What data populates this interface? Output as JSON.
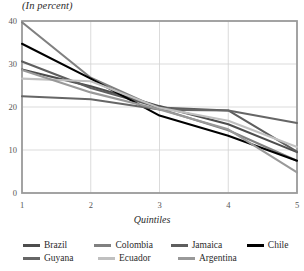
{
  "chart_data": {
    "type": "line",
    "title": "",
    "subtitle": "(In percent)",
    "xlabel": "Quintiles",
    "ylabel": "",
    "x": [
      1,
      2,
      3,
      4,
      5
    ],
    "xtick_labels": [
      "1",
      "2",
      "3",
      "4",
      "5"
    ],
    "ytick_labels": [
      "0",
      "10",
      "20",
      "30",
      "40"
    ],
    "yticks": [
      0,
      10,
      20,
      30,
      40
    ],
    "xlim": [
      1,
      5
    ],
    "ylim": [
      0,
      40
    ],
    "grid": "both-major",
    "legend_position": "bottom",
    "series": [
      {
        "name": "Brazil",
        "color": "#4d4d4d",
        "values": [
          28.7,
          24.8,
          20.2,
          16.0,
          9.5
        ]
      },
      {
        "name": "Colombia",
        "color": "#808080",
        "values": [
          39.7,
          26.8,
          19.6,
          14.6,
          7.5
        ]
      },
      {
        "name": "Jamaica",
        "color": "#5e5e5e",
        "values": [
          30.6,
          24.4,
          19.9,
          19.2,
          9.6
        ]
      },
      {
        "name": "Chile",
        "color": "#000000",
        "values": [
          34.7,
          26.6,
          18.0,
          13.3,
          7.5
        ]
      },
      {
        "name": "Guyana",
        "color": "#666666",
        "values": [
          22.5,
          21.8,
          19.4,
          19.2,
          16.3
        ]
      },
      {
        "name": "Ecuador",
        "color": "#c0c0c0",
        "values": [
          26.6,
          26.0,
          19.8,
          16.8,
          10.7
        ]
      },
      {
        "name": "Argentina",
        "color": "#999999",
        "values": [
          28.6,
          23.4,
          19.4,
          14.8,
          4.8
        ]
      }
    ]
  },
  "legend": {
    "rows": [
      [
        {
          "label": "Brazil",
          "color": "#4d4d4d"
        },
        {
          "label": "Colombia",
          "color": "#808080"
        },
        {
          "label": "Jamaica",
          "color": "#5e5e5e"
        },
        {
          "label": "Chile",
          "color": "#000000"
        }
      ],
      [
        {
          "label": "Guyana",
          "color": "#666666"
        },
        {
          "label": "Ecuador",
          "color": "#c0c0c0"
        },
        {
          "label": "Argentina",
          "color": "#999999"
        }
      ]
    ]
  },
  "axes": {
    "subtitle": "(In percent)",
    "xlabel": "Quintiles"
  }
}
